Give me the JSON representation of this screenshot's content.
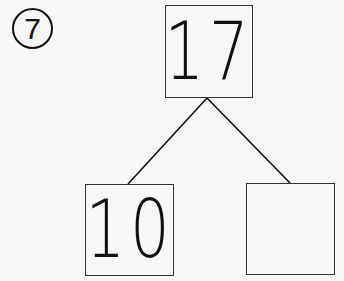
{
  "problem": {
    "number": "7",
    "label": "⑦"
  },
  "number_bond": {
    "whole": "17",
    "parts": [
      "10",
      ""
    ]
  },
  "colors": {
    "ink": "#111111",
    "box_border": "#333333",
    "background": "#f7f7f7"
  }
}
